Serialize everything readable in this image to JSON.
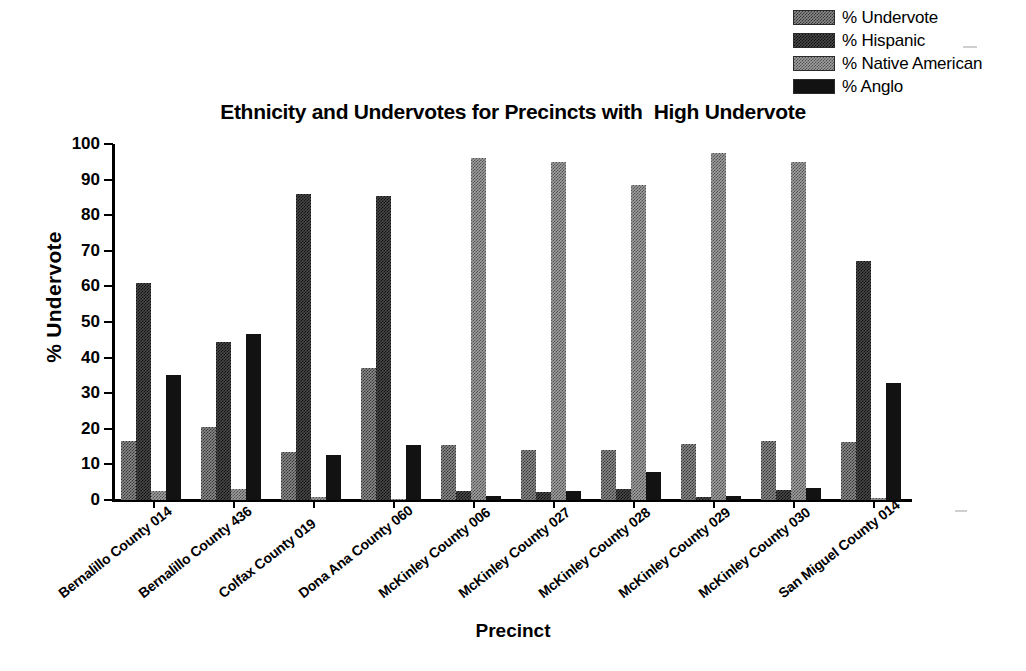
{
  "chart_data": {
    "type": "bar",
    "title": "Ethnicity and Undervotes for Precincts with  High Undervote",
    "xlabel": "Precinct",
    "ylabel": "% Undervote",
    "ylim": [
      0,
      100
    ],
    "ytick_labels": [
      "100",
      "90",
      "80",
      "70",
      "60",
      "50",
      "40",
      "30",
      "20",
      "10",
      "0"
    ],
    "ytick_values": [
      100,
      90,
      80,
      70,
      60,
      50,
      40,
      30,
      20,
      10,
      0
    ],
    "grid": false,
    "legend_position": "top-right",
    "categories": [
      "Bernalillo County 014",
      "Bernalillo County 436",
      "Colfax County 019",
      "Dona Ana County 060",
      "McKinley County 006",
      "McKinley County 027",
      "McKinley County 028",
      "McKinley County 029",
      "McKinley County 030",
      "San Miguel County 014"
    ],
    "series": [
      {
        "name": "% Undervote",
        "color": "#8a8a8a",
        "values": [
          16.5,
          20.5,
          13.5,
          37.0,
          15.5,
          14.0,
          14.0,
          15.8,
          16.7,
          16.3
        ]
      },
      {
        "name": "% Hispanic",
        "color": "#4a4a4a",
        "values": [
          61.0,
          44.5,
          86.0,
          85.3,
          2.5,
          2.3,
          3.2,
          0.8,
          2.8,
          67.0
        ]
      },
      {
        "name": "% Native American",
        "color": "#9e9e9e",
        "values": [
          2.5,
          3.0,
          0.8,
          0.3,
          96.0,
          95.0,
          88.5,
          97.5,
          95.0,
          0.7
        ]
      },
      {
        "name": "% Anglo",
        "color": "#121212",
        "values": [
          35.0,
          46.5,
          12.7,
          15.5,
          1.2,
          2.5,
          8.0,
          1.2,
          3.3,
          33.0
        ]
      }
    ]
  },
  "legend": {
    "items": [
      {
        "label": "% Undervote",
        "swatch": "fill-undervote"
      },
      {
        "label": "% Hispanic",
        "swatch": "fill-hispanic"
      },
      {
        "label": "% Native American",
        "swatch": "fill-native"
      },
      {
        "label": "% Anglo",
        "swatch": "fill-anglo"
      }
    ]
  }
}
